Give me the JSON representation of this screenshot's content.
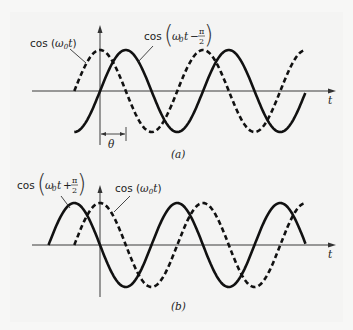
{
  "figure": {
    "panel_a": {
      "caption": "(a)",
      "axis_label": "t",
      "phase_label": "θ",
      "labels": {
        "reference": {
          "func": "cos",
          "arg": "ω",
          "sub": "0",
          "var": "t"
        },
        "shifted": {
          "func": "cos",
          "arg": "ω",
          "sub": "0",
          "var": "t",
          "op": "−",
          "num": "π",
          "den": "2"
        }
      }
    },
    "panel_b": {
      "caption": "(b)",
      "axis_label": "t",
      "labels": {
        "shifted": {
          "func": "cos",
          "arg": "ω",
          "sub": "0",
          "var": "t",
          "op": "+",
          "num": "π",
          "den": "2"
        },
        "reference": {
          "func": "cos",
          "arg": "ω",
          "sub": "0",
          "var": "t"
        }
      }
    }
  },
  "chart_data": [
    {
      "type": "line",
      "title": "(a)",
      "xlabel": "t",
      "ylabel": "",
      "series": [
        {
          "name": "cos(ω0 t)",
          "style": "dashed",
          "phase_shift": 0
        },
        {
          "name": "cos(ω0 t − π/2)",
          "style": "solid",
          "phase_shift": -1.5708
        }
      ],
      "annotations": [
        "θ (phase lag between peaks)"
      ],
      "x_range_periods": [
        -0.25,
        2.0
      ],
      "amplitude": 1
    },
    {
      "type": "line",
      "title": "(b)",
      "xlabel": "t",
      "ylabel": "",
      "series": [
        {
          "name": "cos(ω0 t + π/2)",
          "style": "solid",
          "phase_shift": 1.5708
        },
        {
          "name": "cos(ω0 t)",
          "style": "dashed",
          "phase_shift": 0
        }
      ],
      "x_range_periods": [
        -0.25,
        2.0
      ],
      "amplitude": 1
    }
  ]
}
